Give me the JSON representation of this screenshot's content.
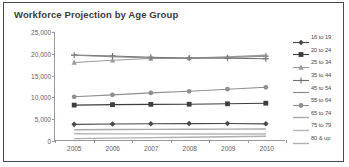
{
  "chart_data": {
    "type": "line",
    "title": "Workforce Projection by Age Group",
    "xlabel": "",
    "ylabel": "",
    "categories": [
      "2005",
      "2006",
      "2007",
      "2008",
      "2009",
      "2010"
    ],
    "x": [
      2005,
      2006,
      2007,
      2008,
      2009,
      2010
    ],
    "ylim": [
      0,
      25000
    ],
    "y_ticks": [
      0,
      5000,
      10000,
      15000,
      20000,
      25000
    ],
    "y_tick_labels": [
      "0",
      "5,000",
      "10,000",
      "15,000",
      "20,000",
      "25,000"
    ],
    "grid": false,
    "legend_position": "right",
    "series": [
      {
        "name": "16 to 19",
        "marker": "diamond",
        "color": "#4a4a4a",
        "values": [
          3620,
          3700,
          3760,
          3800,
          3820,
          3740
        ]
      },
      {
        "name": "20 to 24",
        "marker": "square",
        "color": "#3d3d3d",
        "values": [
          8080,
          8180,
          8250,
          8280,
          8380,
          8520
        ]
      },
      {
        "name": "25 to 34",
        "marker": "triangle",
        "color": "#9b9b9b",
        "values": [
          17950,
          18450,
          18850,
          18950,
          19250,
          19650
        ]
      },
      {
        "name": "35 to 44",
        "marker": "cross",
        "color": "#6e6e6e",
        "values": [
          19650,
          19450,
          19150,
          19000,
          18950,
          18800
        ]
      },
      {
        "name": "45 to 54",
        "marker": "dash",
        "color": "#8a8a8a",
        "values": [
          19600,
          19300,
          19000,
          18900,
          19100,
          19400
        ]
      },
      {
        "name": "55 to 64",
        "marker": "circle",
        "color": "#8f8f8f",
        "values": [
          10000,
          10450,
          10900,
          11280,
          11750,
          12200
        ]
      },
      {
        "name": "65 to 74",
        "marker": "line",
        "color": "#a8a8a8",
        "values": [
          2370,
          2420,
          2470,
          2500,
          2530,
          2560
        ]
      },
      {
        "name": "75 to 79",
        "marker": "line",
        "color": "#b5b5b5",
        "values": [
          1450,
          1430,
          1420,
          1400,
          1390,
          1380
        ]
      },
      {
        "name": "80 & up",
        "marker": "line",
        "color": "#b0b0b0",
        "values": [
          330,
          430,
          540,
          640,
          760,
          880
        ]
      }
    ]
  },
  "colors": {
    "frame_border": "#4a4a4a",
    "axis": "#9a9a9a",
    "title_text": "#3b3b3b",
    "tick_text": "#5d5d5d",
    "legend_text": "#4a4a4a",
    "background": "#ffffff"
  }
}
